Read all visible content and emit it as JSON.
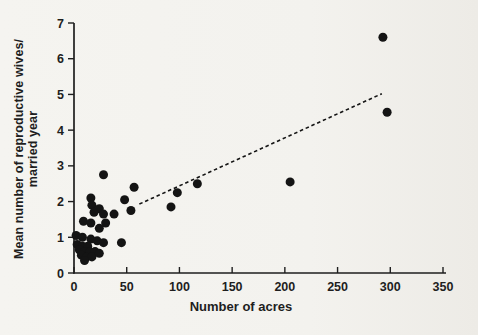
{
  "figure": {
    "background_color": "#f3f2ee",
    "ink_color": "#1e1e1e"
  },
  "chart_data": {
    "type": "scatter",
    "title": "",
    "xlabel": "Number of acres",
    "ylabel_line1": "Mean number of reproductive wives/",
    "ylabel_line2": "married year",
    "xlim": [
      0,
      350
    ],
    "ylim": [
      0,
      7
    ],
    "x_ticks": [
      0,
      50,
      100,
      150,
      200,
      250,
      300,
      350
    ],
    "y_ticks": [
      0,
      1,
      2,
      3,
      4,
      5,
      6,
      7
    ],
    "grid": false,
    "legend": "none",
    "marker": {
      "shape": "circle",
      "color": "#141414",
      "radius_px": 4.5
    },
    "points": [
      [
        293,
        6.6
      ],
      [
        297,
        4.5
      ],
      [
        205,
        2.55
      ],
      [
        117,
        2.5
      ],
      [
        98,
        2.25
      ],
      [
        92,
        1.85
      ],
      [
        57,
        2.4
      ],
      [
        48,
        2.05
      ],
      [
        54,
        1.75
      ],
      [
        45,
        0.85
      ],
      [
        28,
        2.75
      ],
      [
        16,
        2.1
      ],
      [
        17,
        1.9
      ],
      [
        24,
        1.8
      ],
      [
        19,
        1.7
      ],
      [
        28,
        1.65
      ],
      [
        38,
        1.65
      ],
      [
        9,
        1.45
      ],
      [
        16,
        1.4
      ],
      [
        30,
        1.4
      ],
      [
        24,
        1.25
      ],
      [
        2,
        1.05
      ],
      [
        8,
        1.0
      ],
      [
        16,
        0.95
      ],
      [
        22,
        0.9
      ],
      [
        28,
        0.85
      ],
      [
        3,
        0.8
      ],
      [
        8,
        0.75
      ],
      [
        13,
        0.75
      ],
      [
        5,
        0.65
      ],
      [
        10,
        0.6
      ],
      [
        15,
        0.6
      ],
      [
        20,
        0.6
      ],
      [
        7,
        0.5
      ],
      [
        12,
        0.45
      ],
      [
        17,
        0.45
      ],
      [
        24,
        0.55
      ],
      [
        10,
        0.35
      ]
    ],
    "trendline": {
      "style": "dashed",
      "color": "#141414",
      "x_start": 62,
      "y_start": 1.93,
      "x_end": 292,
      "y_end": 5.02
    }
  }
}
